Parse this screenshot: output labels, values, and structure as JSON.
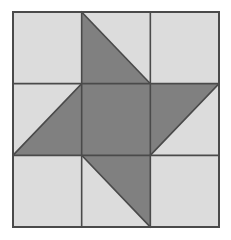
{
  "figure": {
    "kind": "quilt-block-diagram",
    "background_color": "#ffffff",
    "canvas": {
      "width": 231,
      "height": 240
    }
  },
  "palette": {
    "light": "#dcdcdc",
    "dark": "#808080",
    "line": "#4a4a4a",
    "background": "#ffffff"
  },
  "block": {
    "rows": 3,
    "cols": 3,
    "x": 13,
    "y": 12,
    "width": 206,
    "height": 215,
    "cell_width": 68.67,
    "cell_height": 71.67,
    "line_width": 1.6
  },
  "chart_data": {
    "type": "table",
    "categories": [
      "col-1",
      "col-2",
      "col-3"
    ],
    "rows": [
      "row-1",
      "row-2",
      "row-3"
    ],
    "grid": [
      [
        {
          "name": "top-left",
          "style": "solid",
          "fill": "light"
        },
        {
          "name": "top-center",
          "style": "half-square-triangle",
          "dark_corner": "bottom-left",
          "diagonal": "tl-br"
        },
        {
          "name": "top-right",
          "style": "solid",
          "fill": "light"
        }
      ],
      [
        {
          "name": "middle-left",
          "style": "half-square-triangle",
          "dark_corner": "bottom-right",
          "diagonal": "tr-bl"
        },
        {
          "name": "center",
          "style": "solid",
          "fill": "dark"
        },
        {
          "name": "middle-right",
          "style": "half-square-triangle",
          "dark_corner": "top-left",
          "diagonal": "tr-bl"
        }
      ],
      [
        {
          "name": "bottom-left",
          "style": "solid",
          "fill": "light"
        },
        {
          "name": "bottom-center",
          "style": "half-square-triangle",
          "dark_corner": "top-right",
          "diagonal": "tl-br"
        },
        {
          "name": "bottom-right",
          "style": "solid",
          "fill": "light"
        }
      ]
    ],
    "counts": {
      "light_squares": 4,
      "dark_squares": 1,
      "half_square_triangles": 4
    },
    "xlabel": "",
    "ylabel": "",
    "grid_lines": true,
    "legend": []
  }
}
